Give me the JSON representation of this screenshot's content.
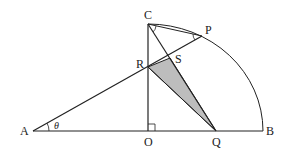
{
  "diagram": {
    "colors": {
      "stroke": "#222222",
      "shade": "#bdbdbd",
      "background": "#ffffff"
    },
    "points": {
      "A": {
        "label": "A",
        "x": 33,
        "y": 131
      },
      "O": {
        "label": "O",
        "x": 148,
        "y": 131
      },
      "Q": {
        "label": "Q",
        "x": 216,
        "y": 131
      },
      "B": {
        "label": "B",
        "x": 263,
        "y": 131
      },
      "C": {
        "label": "C",
        "x": 148,
        "y": 24
      },
      "P": {
        "label": "P",
        "x": 202,
        "y": 36
      },
      "R": {
        "label": "R",
        "x": 148,
        "y": 67
      },
      "S": {
        "label": "S",
        "x": 170,
        "y": 58
      }
    },
    "angle_label": "θ",
    "shaded_region": "triangle RSQ",
    "right_angle_at": "O"
  }
}
